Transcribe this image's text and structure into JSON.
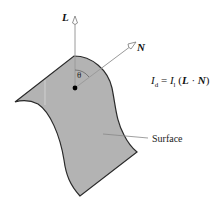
{
  "diagram": {
    "labels": {
      "light_vector": "L",
      "normal_vector": "N",
      "angle": "θ",
      "surface": "Surface"
    },
    "formula": {
      "lhs_symbol": "I",
      "lhs_sub": "d",
      "equals": " = ",
      "rhs_symbol": "I",
      "rhs_sub": "l",
      "open": " (",
      "vec1": "L",
      "dot": " · ",
      "vec2": "N",
      "close": ")"
    },
    "colors": {
      "surface_fill": "#b3b3b3",
      "surface_stroke": "#2a2a2a",
      "vector_line": "#9a9a9a",
      "leader_line": "#888888"
    }
  }
}
